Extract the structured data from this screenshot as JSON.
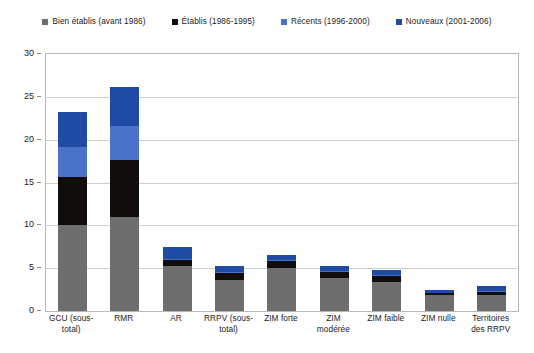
{
  "chart_data": {
    "type": "bar",
    "variant": "stacked-vertical",
    "title": "",
    "xlabel": "",
    "ylabel": "",
    "ylim": [
      0,
      30
    ],
    "ytick_step": 5,
    "ytick_labels": [
      "0",
      "5",
      "10",
      "15",
      "20",
      "25",
      "30"
    ],
    "grid": true,
    "legend_position": "top-center",
    "categories": [
      "GCU (sous-\ntotal)",
      "RMR",
      "AR",
      "RRPV (sous-\ntotal)",
      "ZIM forte",
      "ZIM modérée",
      "ZIM faible",
      "ZIM nulle",
      "Territoires\ndes RRPV"
    ],
    "series": [
      {
        "name": "Bien établis  (avant 1986)",
        "color": "#6e6e6e",
        "values": [
          10.0,
          11.0,
          5.2,
          3.6,
          5.0,
          3.9,
          3.4,
          1.9,
          1.9
        ]
      },
      {
        "name": "Établis (1986-1995)",
        "color": "#120d0d",
        "values": [
          5.7,
          6.6,
          0.7,
          0.8,
          0.8,
          0.7,
          0.7,
          0.2,
          0.35
        ]
      },
      {
        "name": "Récents (1996-2000)",
        "color": "#4a72c8",
        "values": [
          3.4,
          4.0,
          0.2,
          0.2,
          0.1,
          0.1,
          0.1,
          0.05,
          0.1
        ]
      },
      {
        "name": "Nouveaux (2001-2006)",
        "color": "#1f4ba5",
        "values": [
          4.1,
          4.5,
          1.4,
          0.7,
          0.7,
          0.6,
          0.6,
          0.35,
          0.55
        ]
      }
    ],
    "totals": [
      23.2,
      26.1,
      7.5,
      5.3,
      6.6,
      5.3,
      4.8,
      2.5,
      2.9
    ]
  },
  "colors": {
    "bien_etablis": "#6e6e6e",
    "etablis": "#120d0d",
    "recents": "#4a72c8",
    "nouveaux": "#1f4ba5",
    "grid": "#cfcfcf",
    "frame": "#b8b8b8",
    "background": "#ffffff",
    "text": "#1a1a1a"
  }
}
